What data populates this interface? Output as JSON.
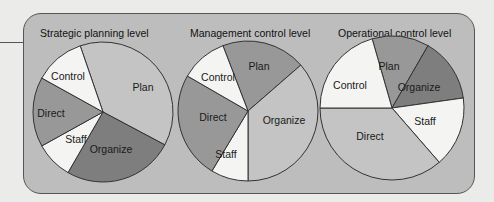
{
  "colors": {
    "page_background": "#ebebea",
    "panel_background": "#bdbdbd",
    "white_slice": "#f4f4f2",
    "light_slice": "#c4c4c4",
    "medium_slice": "#989898",
    "dark_slice": "#7e7e7e",
    "outline": "#333333"
  },
  "charts": [
    {
      "title": "Strategic planning level",
      "center": [
        103,
        112
      ],
      "radius": 70,
      "slices": [
        {
          "label": "Plan",
          "start": 341,
          "end": 478,
          "shade": "light_slice",
          "label_pos": [
            143,
            91
          ]
        },
        {
          "label": "Organize",
          "start": 118,
          "end": 210,
          "shade": "dark_slice",
          "label_pos": [
            111,
            153
          ]
        },
        {
          "label": "Staff",
          "start": 210,
          "end": 241,
          "shade": "white_slice",
          "label_pos": [
            76,
            143
          ]
        },
        {
          "label": "Direct",
          "start": 241,
          "end": 299,
          "shade": "medium_slice",
          "label_pos": [
            51,
            117
          ]
        },
        {
          "label": "Control",
          "start": 299,
          "end": 341,
          "shade": "white_slice",
          "label_pos": [
            68,
            80
          ]
        }
      ]
    },
    {
      "title": "Management control level",
      "center": [
        248,
        111
      ],
      "radius": 70,
      "slices": [
        {
          "label": "Plan",
          "start": 339,
          "end": 409,
          "shade": "medium_slice",
          "label_pos": [
            259,
            70
          ]
        },
        {
          "label": "Organize",
          "start": 49,
          "end": 180,
          "shade": "light_slice",
          "label_pos": [
            284,
            124
          ]
        },
        {
          "label": "Staff",
          "start": 180,
          "end": 211,
          "shade": "white_slice",
          "label_pos": [
            226,
            158
          ]
        },
        {
          "label": "Direct",
          "start": 211,
          "end": 300,
          "shade": "medium_slice",
          "label_pos": [
            213,
            121
          ]
        },
        {
          "label": "Control",
          "start": 300,
          "end": 339,
          "shade": "white_slice",
          "label_pos": [
            218,
            81
          ]
        }
      ]
    },
    {
      "title": "Operational control level",
      "center": [
        392,
        108
      ],
      "radius": 72,
      "slices": [
        {
          "label": "Plan",
          "start": 344,
          "end": 390,
          "shade": "medium_slice",
          "label_pos": [
            389,
            70
          ]
        },
        {
          "label": "Organize",
          "start": 30,
          "end": 82,
          "shade": "dark_slice",
          "label_pos": [
            419,
            91
          ]
        },
        {
          "label": "Staff",
          "start": 82,
          "end": 139,
          "shade": "white_slice",
          "label_pos": [
            425,
            125
          ]
        },
        {
          "label": "Direct",
          "start": 139,
          "end": 270,
          "shade": "light_slice",
          "label_pos": [
            370,
            140
          ]
        },
        {
          "label": "Control",
          "start": 270,
          "end": 344,
          "shade": "white_slice",
          "label_pos": [
            350,
            89
          ]
        }
      ]
    }
  ]
}
